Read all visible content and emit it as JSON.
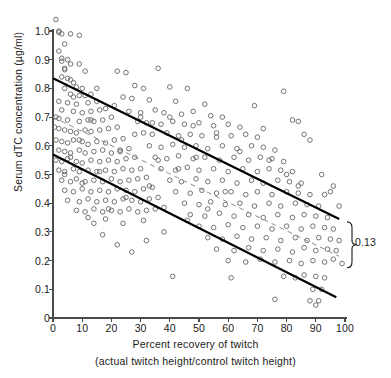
{
  "chart_data": {
    "type": "scatter",
    "title": "",
    "xlabel": "Percent recovery of twitch",
    "xsublabel": "(actual twitch height/control twitch height)",
    "ylabel": "Serum dTC concentration (µg/ml)",
    "xlim": [
      0,
      100
    ],
    "ylim": [
      0,
      1.05
    ],
    "xticks": [
      0,
      10,
      20,
      30,
      40,
      50,
      60,
      70,
      80,
      90,
      100
    ],
    "xticklabels": [
      "0",
      "10",
      "20",
      "30",
      "40",
      "50",
      "60",
      "70",
      "80",
      "90",
      "100"
    ],
    "yticks": [
      0,
      0.1,
      0.2,
      0.3,
      0.4,
      0.5,
      0.6,
      0.7,
      0.8,
      0.9,
      1.0
    ],
    "yticklabels": [
      "0",
      "0.1",
      "0.2",
      "0.3",
      "0.4",
      "0.5",
      "0.6",
      "0.7",
      "0.8",
      "0.9",
      "1.0"
    ],
    "grid": false,
    "legend": null,
    "marker": "open-circle",
    "marker_color": "#6b6b6b",
    "marker_size_px": 4.6,
    "lines": [
      {
        "name": "upper-limit-line",
        "style": "solid",
        "width": 2.2,
        "color": "#000000",
        "x": [
          0,
          98
        ],
        "y": [
          0.835,
          0.345
        ]
      },
      {
        "name": "regression-line",
        "style": "dashed",
        "width": 1.0,
        "color": "#8a8a8a",
        "x": [
          0,
          98
        ],
        "y": [
          0.7,
          0.215
        ]
      },
      {
        "name": "lower-limit-line",
        "style": "solid",
        "width": 2.2,
        "color": "#000000",
        "x": [
          0,
          97
        ],
        "y": [
          0.57,
          0.072
        ]
      }
    ],
    "annotations": [
      {
        "name": "band-width-bracket",
        "text": "0.13",
        "type": "curly-brace-right",
        "x": 100,
        "y_top": 0.335,
        "y_bottom": 0.175
      }
    ],
    "points": [
      [
        1,
        1.04
      ],
      [
        2,
        1.0
      ],
      [
        2,
        0.995
      ],
      [
        3,
        0.99
      ],
      [
        6,
        0.99
      ],
      [
        9,
        0.985
      ],
      [
        4,
        0.955
      ],
      [
        2,
        0.93
      ],
      [
        3,
        0.905
      ],
      [
        3,
        0.895
      ],
      [
        5,
        0.9
      ],
      [
        6,
        0.885
      ],
      [
        4,
        0.87
      ],
      [
        4,
        0.865
      ],
      [
        9,
        0.885
      ],
      [
        3,
        0.84
      ],
      [
        5,
        0.835
      ],
      [
        6,
        0.83
      ],
      [
        7,
        0.82
      ],
      [
        4,
        0.8
      ],
      [
        8,
        0.805
      ],
      [
        10,
        0.8
      ],
      [
        6,
        0.78
      ],
      [
        9,
        0.775
      ],
      [
        11,
        0.775
      ],
      [
        13,
        0.78
      ],
      [
        2,
        0.755
      ],
      [
        5,
        0.75
      ],
      [
        8,
        0.745
      ],
      [
        12,
        0.75
      ],
      [
        15,
        0.755
      ],
      [
        3,
        0.725
      ],
      [
        7,
        0.72
      ],
      [
        10,
        0.715
      ],
      [
        13,
        0.72
      ],
      [
        16,
        0.725
      ],
      [
        18,
        0.73
      ],
      [
        1,
        0.7
      ],
      [
        2,
        0.695
      ],
      [
        5,
        0.69
      ],
      [
        9,
        0.685
      ],
      [
        12,
        0.69
      ],
      [
        14,
        0.685
      ],
      [
        17,
        0.69
      ],
      [
        20,
        0.7
      ],
      [
        0.5,
        0.665
      ],
      [
        2,
        0.66
      ],
      [
        4,
        0.655
      ],
      [
        6,
        0.65
      ],
      [
        8,
        0.645
      ],
      [
        11,
        0.655
      ],
      [
        13,
        0.65
      ],
      [
        16,
        0.655
      ],
      [
        19,
        0.66
      ],
      [
        22,
        0.665
      ],
      [
        1,
        0.62
      ],
      [
        3,
        0.615
      ],
      [
        5,
        0.61
      ],
      [
        7,
        0.62
      ],
      [
        10,
        0.615
      ],
      [
        12,
        0.605
      ],
      [
        15,
        0.615
      ],
      [
        18,
        0.61
      ],
      [
        21,
        0.62
      ],
      [
        24,
        0.625
      ],
      [
        2,
        0.585
      ],
      [
        4,
        0.58
      ],
      [
        6,
        0.575
      ],
      [
        9,
        0.585
      ],
      [
        11,
        0.575
      ],
      [
        14,
        0.58
      ],
      [
        17,
        0.585
      ],
      [
        20,
        0.575
      ],
      [
        23,
        0.585
      ],
      [
        26,
        0.59
      ],
      [
        1,
        0.55
      ],
      [
        3,
        0.545
      ],
      [
        5,
        0.555
      ],
      [
        8,
        0.545
      ],
      [
        10,
        0.54
      ],
      [
        13,
        0.55
      ],
      [
        16,
        0.545
      ],
      [
        19,
        0.55
      ],
      [
        22,
        0.545
      ],
      [
        25,
        0.555
      ],
      [
        28,
        0.56
      ],
      [
        2,
        0.515
      ],
      [
        4,
        0.51
      ],
      [
        7,
        0.52
      ],
      [
        9,
        0.51
      ],
      [
        12,
        0.515
      ],
      [
        15,
        0.51
      ],
      [
        18,
        0.515
      ],
      [
        21,
        0.51
      ],
      [
        24,
        0.52
      ],
      [
        27,
        0.515
      ],
      [
        30,
        0.52
      ],
      [
        3,
        0.48
      ],
      [
        6,
        0.475
      ],
      [
        8,
        0.485
      ],
      [
        11,
        0.475
      ],
      [
        14,
        0.48
      ],
      [
        17,
        0.475
      ],
      [
        20,
        0.485
      ],
      [
        23,
        0.475
      ],
      [
        26,
        0.48
      ],
      [
        29,
        0.485
      ],
      [
        32,
        0.49
      ],
      [
        4,
        0.445
      ],
      [
        7,
        0.44
      ],
      [
        10,
        0.45
      ],
      [
        13,
        0.44
      ],
      [
        16,
        0.445
      ],
      [
        19,
        0.44
      ],
      [
        22,
        0.45
      ],
      [
        25,
        0.445
      ],
      [
        28,
        0.44
      ],
      [
        31,
        0.45
      ],
      [
        34,
        0.455
      ],
      [
        5,
        0.41
      ],
      [
        9,
        0.405
      ],
      [
        12,
        0.415
      ],
      [
        15,
        0.405
      ],
      [
        18,
        0.41
      ],
      [
        21,
        0.405
      ],
      [
        24,
        0.415
      ],
      [
        27,
        0.41
      ],
      [
        30,
        0.405
      ],
      [
        33,
        0.415
      ],
      [
        36,
        0.42
      ],
      [
        8,
        0.375
      ],
      [
        11,
        0.37
      ],
      [
        14,
        0.38
      ],
      [
        17,
        0.37
      ],
      [
        20,
        0.375
      ],
      [
        23,
        0.37
      ],
      [
        26,
        0.38
      ],
      [
        29,
        0.37
      ],
      [
        32,
        0.375
      ],
      [
        35,
        0.38
      ],
      [
        38,
        0.385
      ],
      [
        22,
        0.86
      ],
      [
        25,
        0.855
      ],
      [
        36,
        0.87
      ],
      [
        28,
        0.81
      ],
      [
        31,
        0.8
      ],
      [
        40,
        0.805
      ],
      [
        46,
        0.8
      ],
      [
        24,
        0.77
      ],
      [
        27,
        0.765
      ],
      [
        33,
        0.76
      ],
      [
        42,
        0.755
      ],
      [
        52,
        0.745
      ],
      [
        26,
        0.72
      ],
      [
        30,
        0.715
      ],
      [
        35,
        0.725
      ],
      [
        38,
        0.715
      ],
      [
        44,
        0.71
      ],
      [
        48,
        0.72
      ],
      [
        54,
        0.705
      ],
      [
        58,
        0.7
      ],
      [
        29,
        0.685
      ],
      [
        32,
        0.68
      ],
      [
        37,
        0.675
      ],
      [
        41,
        0.685
      ],
      [
        45,
        0.675
      ],
      [
        50,
        0.68
      ],
      [
        55,
        0.67
      ],
      [
        60,
        0.675
      ],
      [
        64,
        0.665
      ],
      [
        31,
        0.645
      ],
      [
        34,
        0.64
      ],
      [
        39,
        0.645
      ],
      [
        43,
        0.635
      ],
      [
        47,
        0.64
      ],
      [
        51,
        0.635
      ],
      [
        56,
        0.645
      ],
      [
        61,
        0.635
      ],
      [
        66,
        0.64
      ],
      [
        70,
        0.63
      ],
      [
        33,
        0.6
      ],
      [
        37,
        0.595
      ],
      [
        41,
        0.605
      ],
      [
        45,
        0.595
      ],
      [
        49,
        0.6
      ],
      [
        53,
        0.59
      ],
      [
        58,
        0.6
      ],
      [
        63,
        0.59
      ],
      [
        68,
        0.6
      ],
      [
        72,
        0.595
      ],
      [
        76,
        0.585
      ],
      [
        35,
        0.56
      ],
      [
        39,
        0.555
      ],
      [
        43,
        0.565
      ],
      [
        48,
        0.555
      ],
      [
        52,
        0.56
      ],
      [
        57,
        0.55
      ],
      [
        62,
        0.56
      ],
      [
        67,
        0.55
      ],
      [
        71,
        0.56
      ],
      [
        75,
        0.555
      ],
      [
        79,
        0.545
      ],
      [
        37,
        0.52
      ],
      [
        42,
        0.515
      ],
      [
        46,
        0.525
      ],
      [
        50,
        0.515
      ],
      [
        55,
        0.52
      ],
      [
        60,
        0.51
      ],
      [
        65,
        0.52
      ],
      [
        70,
        0.51
      ],
      [
        74,
        0.52
      ],
      [
        78,
        0.515
      ],
      [
        82,
        0.51
      ],
      [
        40,
        0.48
      ],
      [
        44,
        0.475
      ],
      [
        49,
        0.485
      ],
      [
        53,
        0.475
      ],
      [
        58,
        0.48
      ],
      [
        63,
        0.47
      ],
      [
        68,
        0.48
      ],
      [
        72,
        0.47
      ],
      [
        77,
        0.48
      ],
      [
        81,
        0.475
      ],
      [
        85,
        0.47
      ],
      [
        42,
        0.44
      ],
      [
        47,
        0.435
      ],
      [
        51,
        0.445
      ],
      [
        56,
        0.435
      ],
      [
        61,
        0.44
      ],
      [
        66,
        0.43
      ],
      [
        70,
        0.44
      ],
      [
        75,
        0.43
      ],
      [
        80,
        0.44
      ],
      [
        84,
        0.435
      ],
      [
        88,
        0.43
      ],
      [
        45,
        0.4
      ],
      [
        50,
        0.395
      ],
      [
        54,
        0.405
      ],
      [
        59,
        0.395
      ],
      [
        64,
        0.4
      ],
      [
        69,
        0.39
      ],
      [
        74,
        0.4
      ],
      [
        78,
        0.39
      ],
      [
        83,
        0.4
      ],
      [
        87,
        0.395
      ],
      [
        91,
        0.39
      ],
      [
        47,
        0.36
      ],
      [
        52,
        0.355
      ],
      [
        57,
        0.365
      ],
      [
        62,
        0.355
      ],
      [
        67,
        0.36
      ],
      [
        72,
        0.35
      ],
      [
        77,
        0.36
      ],
      [
        82,
        0.35
      ],
      [
        86,
        0.36
      ],
      [
        90,
        0.355
      ],
      [
        94,
        0.35
      ],
      [
        50,
        0.32
      ],
      [
        55,
        0.315
      ],
      [
        60,
        0.325
      ],
      [
        65,
        0.315
      ],
      [
        70,
        0.32
      ],
      [
        75,
        0.31
      ],
      [
        80,
        0.32
      ],
      [
        85,
        0.31
      ],
      [
        89,
        0.32
      ],
      [
        93,
        0.315
      ],
      [
        96,
        0.31
      ],
      [
        53,
        0.28
      ],
      [
        58,
        0.275
      ],
      [
        63,
        0.285
      ],
      [
        68,
        0.275
      ],
      [
        73,
        0.28
      ],
      [
        78,
        0.27
      ],
      [
        83,
        0.28
      ],
      [
        87,
        0.27
      ],
      [
        91,
        0.28
      ],
      [
        95,
        0.275
      ],
      [
        98,
        0.27
      ],
      [
        56,
        0.24
      ],
      [
        62,
        0.235
      ],
      [
        67,
        0.245
      ],
      [
        72,
        0.235
      ],
      [
        77,
        0.24
      ],
      [
        82,
        0.23
      ],
      [
        86,
        0.245
      ],
      [
        90,
        0.235
      ],
      [
        94,
        0.24
      ],
      [
        97,
        0.235
      ],
      [
        60,
        0.2
      ],
      [
        66,
        0.195
      ],
      [
        71,
        0.205
      ],
      [
        76,
        0.195
      ],
      [
        81,
        0.2
      ],
      [
        85,
        0.19
      ],
      [
        89,
        0.2
      ],
      [
        93,
        0.195
      ],
      [
        96,
        0.205
      ],
      [
        99,
        0.19
      ],
      [
        41,
        0.145
      ],
      [
        61,
        0.14
      ],
      [
        79,
        0.145
      ],
      [
        83,
        0.14
      ],
      [
        86,
        0.15
      ],
      [
        90,
        0.145
      ],
      [
        93,
        0.14
      ],
      [
        76,
        0.065
      ],
      [
        89,
        0.1
      ],
      [
        92,
        0.1
      ],
      [
        88,
        0.06
      ],
      [
        91,
        0.06
      ],
      [
        90,
        0.045
      ],
      [
        31,
        0.34
      ],
      [
        24,
        0.33
      ],
      [
        18,
        0.345
      ],
      [
        12,
        0.35
      ],
      [
        69,
        0.74
      ],
      [
        79,
        0.79
      ],
      [
        72,
        0.66
      ],
      [
        86,
        0.64
      ],
      [
        84,
        0.685
      ],
      [
        82,
        0.69
      ],
      [
        88,
        0.62
      ],
      [
        92,
        0.5
      ],
      [
        95,
        0.44
      ],
      [
        98,
        0.39
      ],
      [
        96,
        0.46
      ],
      [
        93,
        0.43
      ],
      [
        36,
        0.55
      ],
      [
        44,
        0.62
      ],
      [
        30,
        0.7
      ],
      [
        21,
        0.74
      ],
      [
        15,
        0.8
      ],
      [
        11,
        0.86
      ],
      [
        7,
        0.77
      ],
      [
        13,
        0.69
      ],
      [
        9,
        0.62
      ],
      [
        6,
        0.56
      ],
      [
        4,
        0.5
      ],
      [
        10,
        0.47
      ],
      [
        16,
        0.51
      ],
      [
        23,
        0.58
      ],
      [
        28,
        0.64
      ],
      [
        34,
        0.68
      ],
      [
        40,
        0.7
      ],
      [
        48,
        0.67
      ],
      [
        56,
        0.63
      ],
      [
        64,
        0.58
      ],
      [
        74,
        0.55
      ],
      [
        80,
        0.5
      ],
      [
        84,
        0.46
      ],
      [
        59,
        0.44
      ],
      [
        53,
        0.38
      ],
      [
        46,
        0.34
      ],
      [
        38,
        0.3
      ],
      [
        32,
        0.27
      ],
      [
        27,
        0.23
      ],
      [
        22,
        0.255
      ],
      [
        17,
        0.29
      ],
      [
        14,
        0.33
      ],
      [
        19,
        0.38
      ],
      [
        25,
        0.42
      ],
      [
        33,
        0.46
      ],
      [
        43,
        0.52
      ],
      [
        49,
        0.56
      ]
    ]
  }
}
